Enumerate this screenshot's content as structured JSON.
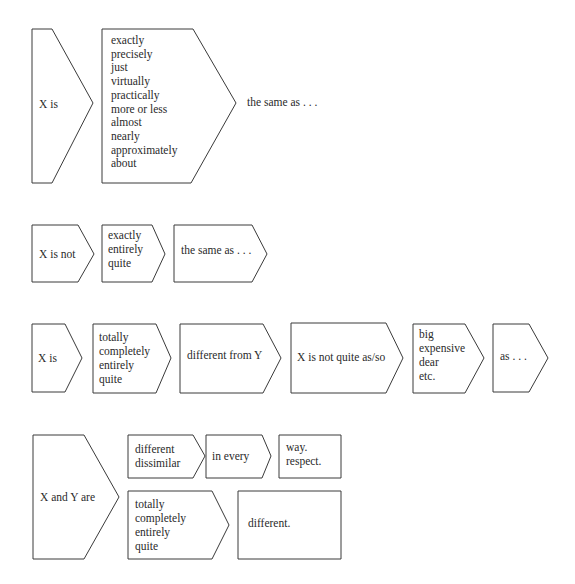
{
  "rows": [
    {
      "name": "row-1",
      "boxes": [
        {
          "lines": [
            "X is"
          ]
        },
        {
          "lines": [
            "exactly",
            "precisely",
            "just",
            "virtually",
            "practically",
            "more or less",
            "almost",
            "nearly",
            "approximately",
            "about"
          ]
        }
      ],
      "tail": "the same as . . ."
    },
    {
      "name": "row-2",
      "boxes": [
        {
          "lines": [
            "X is not"
          ]
        },
        {
          "lines": [
            "exactly",
            "entirely",
            "quite"
          ]
        },
        {
          "lines": [
            "the same as . . ."
          ]
        }
      ]
    },
    {
      "name": "row-3",
      "boxes": [
        {
          "lines": [
            "X is"
          ]
        },
        {
          "lines": [
            "totally",
            "completely",
            "entirely",
            "quite"
          ]
        },
        {
          "lines": [
            "different from Y"
          ]
        },
        {
          "lines": [
            "X is not quite as/so"
          ]
        },
        {
          "lines": [
            "big",
            "expensive",
            "dear",
            "etc."
          ]
        },
        {
          "lines": [
            "as . . ."
          ]
        }
      ]
    },
    {
      "name": "row-4",
      "boxes": [
        {
          "lines": [
            "X and Y are"
          ]
        },
        {
          "lines": [
            "different",
            "dissimilar"
          ]
        },
        {
          "lines": [
            "in every"
          ]
        },
        {
          "lines": [
            "way.",
            "respect."
          ]
        },
        {
          "lines": [
            "totally",
            "completely",
            "entirely",
            "quite"
          ]
        },
        {
          "lines": [
            "different."
          ]
        }
      ]
    }
  ]
}
